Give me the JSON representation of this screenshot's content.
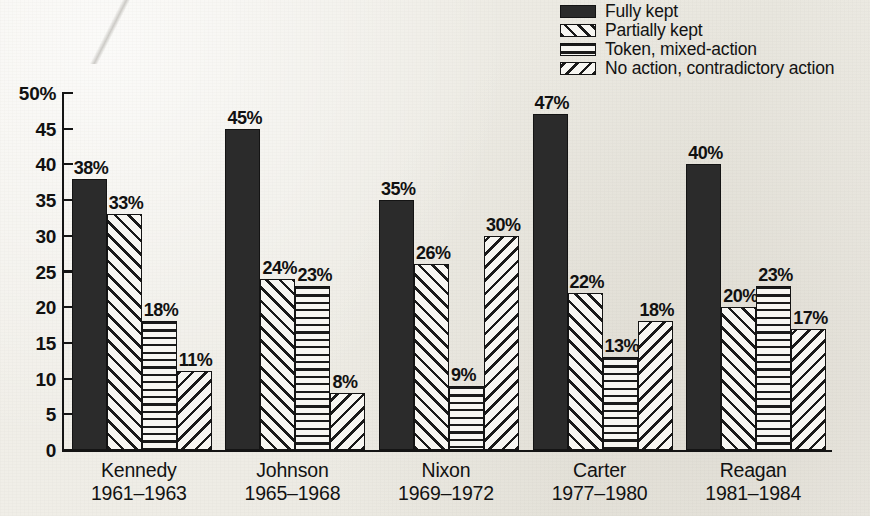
{
  "chart_data": {
    "type": "bar",
    "title": "",
    "subtitle": "",
    "xlabel": "",
    "ylabel": "",
    "ylim": [
      0,
      50
    ],
    "y_unit": "%",
    "grid": false,
    "legend_position": "top-right",
    "y_ticks": [
      "50%",
      "45",
      "40",
      "35",
      "30",
      "25",
      "20",
      "15",
      "10",
      "5",
      "0"
    ],
    "y_tick_values": [
      50,
      45,
      40,
      35,
      30,
      25,
      20,
      15,
      10,
      5,
      0
    ],
    "categories": [
      "Kennedy 1961–1963",
      "Johnson 1965–1968",
      "Nixon 1969–1972",
      "Carter 1977–1980",
      "Reagan 1981–1984"
    ],
    "series": [
      {
        "name": "Fully kept",
        "pattern": "solid",
        "values": [
          38,
          45,
          35,
          47,
          40
        ]
      },
      {
        "name": "Partially kept",
        "pattern": "diagonal-forward",
        "values": [
          33,
          24,
          26,
          22,
          20
        ]
      },
      {
        "name": "Token, mixed-action",
        "pattern": "horizontal",
        "values": [
          18,
          23,
          9,
          13,
          23
        ]
      },
      {
        "name": "No action, contradictory action",
        "pattern": "diagonal-backward",
        "values": [
          11,
          8,
          30,
          18,
          17
        ]
      }
    ],
    "data_labels": [
      [
        "38%",
        "33%",
        "18%",
        "11%"
      ],
      [
        "45%",
        "24%",
        "23%",
        "8%"
      ],
      [
        "35%",
        "26%",
        "9%",
        "30%"
      ],
      [
        "47%",
        "22%",
        "13%",
        "18%"
      ],
      [
        "40%",
        "20%",
        "23%",
        "17%"
      ]
    ]
  },
  "legend": {
    "items": [
      {
        "label": "Fully kept",
        "pattern": "solid"
      },
      {
        "label": "Partially kept",
        "pattern": "diagonal-forward"
      },
      {
        "label": "Token, mixed-action",
        "pattern": "horizontal"
      },
      {
        "label": "No action, contradictory action",
        "pattern": "diagonal-backward"
      }
    ]
  },
  "groups": [
    {
      "name": "Kennedy",
      "years": "1961–1963"
    },
    {
      "name": "Johnson",
      "years": "1965–1968"
    },
    {
      "name": "Nixon",
      "years": "1969–1972"
    },
    {
      "name": "Carter",
      "years": "1977–1980"
    },
    {
      "name": "Reagan",
      "years": "1981–1984"
    }
  ],
  "colors": {
    "ink": "#141414",
    "solid_fill": "#2b2b2b",
    "hatch_bg": "#f7f6f2",
    "paper": "#eeece5"
  }
}
